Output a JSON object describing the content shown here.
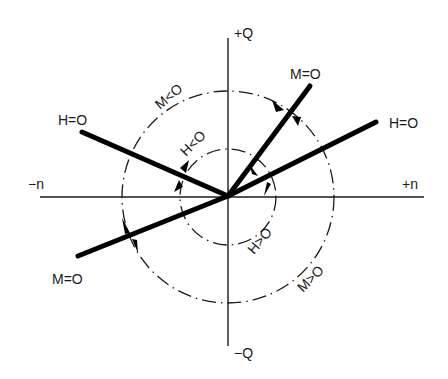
{
  "diagram": {
    "type": "operating-quadrant diagram",
    "origin": [
      228,
      196
    ],
    "axes": {
      "positive_y_label": "+Q",
      "negative_y_label": "−Q",
      "positive_x_label": "+n",
      "negative_x_label": "−n"
    },
    "rays": [
      {
        "name": "H=O upper-left",
        "label": "H=O",
        "end": [
          82,
          132
        ]
      },
      {
        "name": "H=O right",
        "label": "H=O",
        "end": [
          376,
          122
        ]
      },
      {
        "name": "M=O upper-right",
        "label": "M=O",
        "end": [
          310,
          86
        ]
      },
      {
        "name": "M=O lower-left",
        "label": "M=O",
        "end": [
          78,
          256
        ]
      }
    ],
    "circles": [
      {
        "name": "outer",
        "radius": 106,
        "label_top": "M<O",
        "label_bottom": "M>O"
      },
      {
        "name": "inner",
        "radius": 48,
        "label_top": "H<O",
        "label_bottom": "H>O"
      }
    ],
    "labels": {
      "h_zero_left": "H=O",
      "h_zero_right": "H=O",
      "m_zero_top": "M=O",
      "m_zero_bottom": "M=O",
      "m_less": "M<O",
      "m_greater": "M>O",
      "h_less": "H<O",
      "h_greater": "H>O"
    },
    "colors": {
      "line": "#000000",
      "background": "#ffffff"
    }
  }
}
